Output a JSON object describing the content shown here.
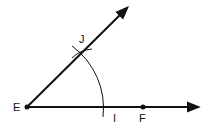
{
  "diagram": {
    "type": "geometric-construction",
    "colors": {
      "ink": "#111111",
      "background": "#ffffff"
    },
    "points": {
      "E": {
        "label": "E",
        "x": 27,
        "y": 107
      },
      "F": {
        "label": "F",
        "x": 143,
        "y": 107
      },
      "I": {
        "label": "I",
        "x": 104,
        "y": 107
      },
      "J": {
        "label": "J",
        "x": 80,
        "y": 52
      }
    },
    "rays": [
      {
        "name": "ray-EF",
        "from": "E",
        "to": [
          200,
          107
        ]
      },
      {
        "name": "ray-EJ",
        "from": "E",
        "to": [
          128,
          6
        ]
      }
    ],
    "arc": {
      "center": "E",
      "radius": 77,
      "through": [
        "I",
        "J"
      ]
    }
  }
}
